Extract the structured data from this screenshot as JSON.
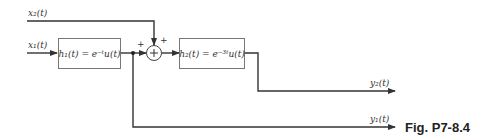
{
  "diagram": {
    "inputs": {
      "x1": "x₁(t)",
      "x2": "x₂(t)"
    },
    "blocks": {
      "h1": "h₁(t) = e⁻ᵗu(t)",
      "h2": "h₂(t) = e⁻³ᵗu(t)"
    },
    "summer": {
      "symbol": "+",
      "sign_left": "+",
      "sign_top": "+"
    },
    "outputs": {
      "y1": "y₁(t)",
      "y2": "y₂(t)"
    },
    "caption": "Fig. P7-8.4"
  }
}
